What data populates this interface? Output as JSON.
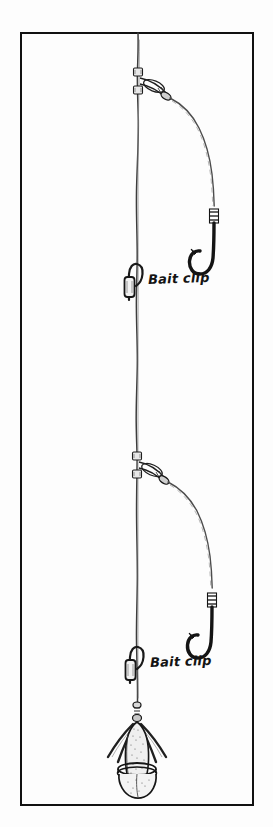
{
  "figure": {
    "background_color": "#fdfdfd",
    "ink_color": "#1a1a1a",
    "line_color": "#4a4a4a",
    "frame": {
      "name": "illustration-border",
      "x": 20,
      "y": 32,
      "width": 233,
      "height": 773,
      "stroke": "#111111",
      "stroke_width": 2
    }
  },
  "labels": [
    {
      "id": "upper",
      "text": "Bait clip",
      "x": 148,
      "y": 272
    },
    {
      "id": "lower",
      "text": "Bait clip",
      "x": 150,
      "y": 655
    }
  ],
  "components": [
    {
      "name": "main-line",
      "type": "mainline"
    },
    {
      "name": "upper-snood-swivel",
      "type": "swivel"
    },
    {
      "name": "upper-snood",
      "type": "snood"
    },
    {
      "name": "upper-hook",
      "type": "hook"
    },
    {
      "name": "upper-bait-clip",
      "type": "bait-clip"
    },
    {
      "name": "lower-snood-swivel",
      "type": "swivel"
    },
    {
      "name": "lower-snood",
      "type": "snood"
    },
    {
      "name": "lower-hook",
      "type": "hook"
    },
    {
      "name": "lower-bait-clip",
      "type": "bait-clip"
    },
    {
      "name": "lead-sinker",
      "type": "weight"
    },
    {
      "name": "grip-wires",
      "type": "wires"
    }
  ]
}
